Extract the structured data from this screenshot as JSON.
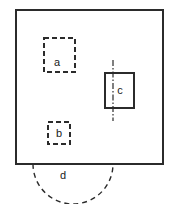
{
  "figure": {
    "type": "technical-drawing",
    "background_color": "#ffffff",
    "line_color": "#2b2b2b",
    "label_color": "#1a1a1a"
  },
  "outline": {
    "name": "plate-outline",
    "shape": "rectangle",
    "stroke": "#2b2b2b",
    "stroke_width": 2,
    "x": 16,
    "y": 10,
    "width": 147,
    "height": 154
  },
  "features": [
    {
      "id": "a",
      "label": "a",
      "shape": "rectangle",
      "line_style": "dashed",
      "stroke": "#2b2b2b",
      "stroke_width": 2,
      "dash_pattern": "5 3",
      "x": 44,
      "y": 38,
      "width": 31,
      "height": 34,
      "label_x": 57,
      "label_y": 63,
      "has_centerline": false
    },
    {
      "id": "b",
      "label": "b",
      "shape": "rectangle",
      "line_style": "dashed",
      "stroke": "#2b2b2b",
      "stroke_width": 2,
      "dash_pattern": "5 3",
      "x": 48,
      "y": 122,
      "width": 22,
      "height": 22,
      "label_x": 59,
      "label_y": 134,
      "has_centerline": false
    },
    {
      "id": "c",
      "label": "c",
      "shape": "rectangle",
      "line_style": "solid",
      "stroke": "#2b2b2b",
      "stroke_width": 2,
      "dash_pattern": "",
      "x": 105,
      "y": 73,
      "width": 29,
      "height": 35,
      "label_x": 120,
      "label_y": 91,
      "has_centerline": true
    }
  ],
  "centerline": {
    "name": "centerline-c",
    "line_style": "dash-dot",
    "stroke": "#2b2b2b",
    "stroke_width": 1.2,
    "dash_pattern": "6 2 1.5 2",
    "x": 113,
    "y_top": 60,
    "y_bottom": 121
  },
  "arc": {
    "id": "d",
    "label": "d",
    "shape": "semicircular-arc",
    "line_style": "dashed",
    "stroke": "#2b2b2b",
    "stroke_width": 1.4,
    "dash_pattern": "5 4",
    "start_x": 33,
    "start_y": 164,
    "end_x": 113,
    "end_y": 164,
    "radius": 40,
    "bottom_y": 191,
    "label_x": 63,
    "label_y": 176
  }
}
